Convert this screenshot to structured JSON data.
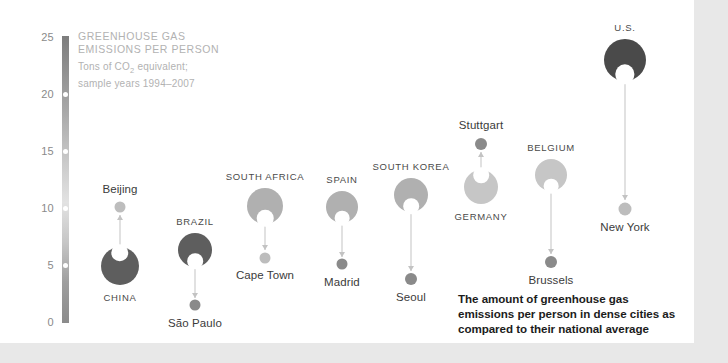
{
  "header": {
    "title_line1": "GREENHOUSE GAS",
    "title_line2": "EMISSIONS PER PERSON",
    "sub_line1_pre": "Tons of CO",
    "sub_line1_sub": "2",
    "sub_line1_post": " equivalent;",
    "sub_line2": "sample years 1994–2007"
  },
  "caption": "The amount of greenhouse gas emissions per person in dense cities as compared to their national average",
  "colors": {
    "country_dark": "#5e5e5e",
    "country_darkest": "#4a4a4a",
    "country_mid": "#b0b0b0",
    "country_light": "#c6c6c6",
    "city_dot_dark": "#8a8a8a",
    "city_dot_light": "#bdbdbd",
    "stem": "#c3c3c3",
    "axis_text": "#8a8a8a",
    "header_text": "#b2b2b2",
    "canvas": "#ffffff",
    "page": "#e8e8e8"
  },
  "chart_data": {
    "type": "scatter",
    "title": "GREENHOUSE GAS EMISSIONS PER PERSON",
    "subtitle": "Tons of CO2 equivalent; sample years 1994–2007",
    "ylabel": "Tons of CO2 equivalent",
    "xlabel": "",
    "ylim": [
      0,
      25
    ],
    "yticks": [
      0,
      5,
      10,
      15,
      20,
      25
    ],
    "grid": false,
    "legend": "none",
    "annotation": "The amount of greenhouse gas emissions per person in dense cities as compared to their national average",
    "series": [
      {
        "name": "China / Beijing",
        "country_label": "CHINA",
        "city_label": "Beijing",
        "country_value": 5.0,
        "city_value": 10.1,
        "direction": "up"
      },
      {
        "name": "Brazil / São Paulo",
        "country_label": "BRAZIL",
        "city_label": "São Paulo",
        "country_value": 6.4,
        "city_value": 1.5,
        "direction": "down"
      },
      {
        "name": "South Africa / Cape Town",
        "country_label": "SOUTH AFRICA",
        "city_label": "Cape Town",
        "country_value": 10.2,
        "city_value": 5.7,
        "direction": "down"
      },
      {
        "name": "Spain / Madrid",
        "country_label": "SPAIN",
        "city_label": "Madrid",
        "country_value": 10.1,
        "city_value": 5.1,
        "direction": "down"
      },
      {
        "name": "South Korea / Seoul",
        "country_label": "SOUTH KOREA",
        "city_label": "Seoul",
        "country_value": 11.2,
        "city_value": 3.8,
        "direction": "down"
      },
      {
        "name": "Germany / Stuttgart",
        "country_label": "GERMANY",
        "city_label": "Stuttgart",
        "country_value": 11.9,
        "city_value": 15.7,
        "direction": "up"
      },
      {
        "name": "Belgium / Brussels",
        "country_label": "BELGIUM",
        "city_label": "Brussels",
        "country_value": 12.9,
        "city_value": 5.3,
        "direction": "down"
      },
      {
        "name": "U.S. / New York",
        "country_label": "U.S.",
        "city_label": "New York",
        "country_value": 23.0,
        "city_value": 10.0,
        "direction": "down"
      }
    ]
  },
  "axis": {
    "ticks": [
      {
        "label": "25"
      },
      {
        "label": "20"
      },
      {
        "label": "15"
      },
      {
        "label": "10"
      },
      {
        "label": "5"
      },
      {
        "label": "0"
      }
    ]
  }
}
